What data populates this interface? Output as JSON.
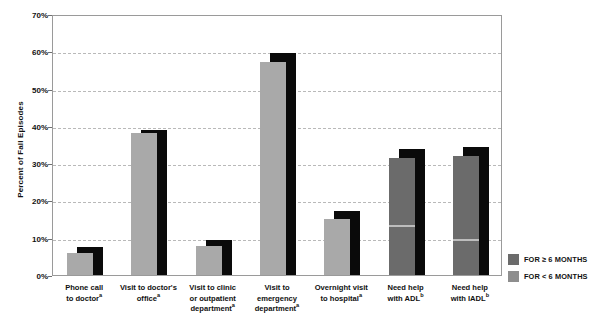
{
  "chart_data": {
    "type": "bar",
    "title": "",
    "xlabel": "",
    "ylabel": "Percent of Fall Episodes",
    "ylim": [
      0,
      70
    ],
    "ytick_labels": [
      "0%",
      "10%",
      "20%",
      "30%",
      "40%",
      "50%",
      "60%",
      "70%"
    ],
    "ytick_values": [
      0,
      10,
      20,
      30,
      40,
      50,
      60,
      70
    ],
    "grid": true,
    "legend_position": "right-bottom",
    "categories": [
      "Phone call to doctor",
      "Visit to doctor's office",
      "Visit to clinic or outpatient department",
      "Visit to emergency department",
      "Overnight visit to hospital",
      "Need help with ADL",
      "Need help with IADL"
    ],
    "category_lines": [
      [
        "Phone call",
        "to doctor"
      ],
      [
        "Visit to doctor's",
        "office"
      ],
      [
        "Visit to clinic",
        "or outpatient",
        "department"
      ],
      [
        "Visit to",
        "emergency",
        "department"
      ],
      [
        "Overnight visit",
        "to hospital"
      ],
      [
        "Need help",
        "with ADL"
      ],
      [
        "Need help",
        "with IADL"
      ]
    ],
    "category_footnotes": [
      "a",
      "a",
      "a",
      "a",
      "a",
      "b",
      "b"
    ],
    "series": [
      {
        "name": "FOR ≥ 6 MONTHS",
        "color": "#a9a9a9",
        "values": [
          6.0,
          38.0,
          7.8,
          57.0,
          15.0,
          31.5,
          32.0
        ]
      },
      {
        "name": "FOR < 6 MONTHS",
        "color": "#0a0a0a",
        "values": [
          7.4,
          39.0,
          9.5,
          59.5,
          17.3,
          33.8,
          34.3
        ]
      }
    ]
  },
  "legend": {
    "items": [
      {
        "label": "FOR ≥ 6 MONTHS",
        "color": "#6b6b6b"
      },
      {
        "label": "FOR < 6 MONTHS",
        "color": "#8e8e8e"
      }
    ]
  },
  "axis": {
    "y_title": "Percent of Fall Episodes"
  }
}
